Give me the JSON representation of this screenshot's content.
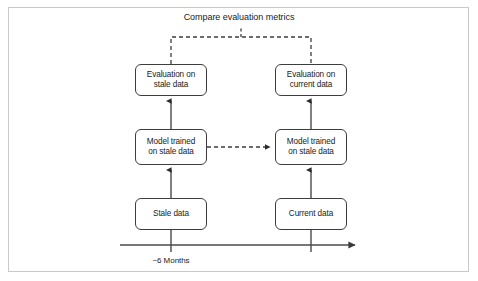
{
  "figure": {
    "title": "Compare evaluation metrics",
    "background_color": "#ffffff",
    "frame_color": "#c9c9c9",
    "line_color": "#3d3d3d",
    "dashed_color": "#555555",
    "axis_color": "#4a4a4a"
  },
  "nodes": {
    "eval_stale": "Evaluation on\nstale data",
    "eval_current": "Evaluation on\ncurrent data",
    "model_left": "Model trained\non stale data",
    "model_right": "Model trained\non stale data",
    "stale_data": "Stale data",
    "current_data": "Current data"
  },
  "timeline": {
    "tick_label": "~6 Months"
  },
  "connectors": [
    {
      "name": "stale-data-to-model-left",
      "style": "solid",
      "arrow": "up"
    },
    {
      "name": "model-left-to-eval-stale",
      "style": "solid",
      "arrow": "up"
    },
    {
      "name": "current-data-to-model-right",
      "style": "solid",
      "arrow": "up"
    },
    {
      "name": "model-right-to-eval-current",
      "style": "solid",
      "arrow": "up"
    },
    {
      "name": "model-left-to-model-right",
      "style": "dashed",
      "arrow": "right"
    },
    {
      "name": "eval-stale-to-compare-bracket",
      "style": "dashed",
      "arrow": "none"
    },
    {
      "name": "eval-current-to-compare-bracket",
      "style": "dashed",
      "arrow": "none"
    },
    {
      "name": "timeline-axis",
      "style": "solid",
      "arrow": "right"
    }
  ]
}
